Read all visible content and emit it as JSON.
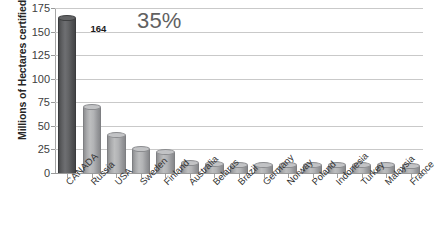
{
  "chart_data": {
    "type": "bar",
    "title": "",
    "subtitle": "",
    "xlabel": "",
    "ylabel": "Millions of Hectares certified",
    "ylim": [
      0,
      175
    ],
    "yticks": [
      0,
      25,
      50,
      75,
      100,
      125,
      150,
      175
    ],
    "grid": true,
    "legend": false,
    "legend_position": "none",
    "style": "3d-cylinder",
    "categories": [
      "CANADA",
      "Russia",
      "USA",
      "Sweden",
      "Finland",
      "Australia",
      "Belarus",
      "Brazil",
      "Germany",
      "Norway",
      "Poland",
      "Indonesia",
      "Turkey",
      "Malaysia",
      "France"
    ],
    "values": [
      164,
      70,
      40,
      26,
      22,
      11,
      10,
      9,
      9,
      9,
      9,
      8,
      8,
      8,
      7
    ],
    "data_labels": [
      {
        "category": "CANADA",
        "text": "164"
      }
    ],
    "annotations": [
      {
        "text": "35%",
        "category": "CANADA"
      }
    ],
    "colors": {
      "highlight_bar": "#58595b",
      "default_bar": "#b0b1b3",
      "gridline": "#c9c9c9",
      "axis": "#9a9a9a",
      "tick_label": "#404040",
      "annotation": "#616161",
      "data_label": "#1a1a1a",
      "background": "#ffffff"
    }
  }
}
